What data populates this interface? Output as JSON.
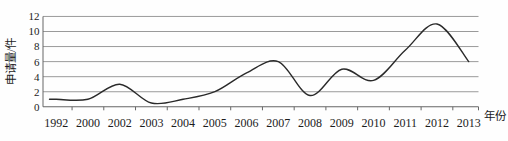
{
  "chart_data": {
    "type": "line",
    "title": "",
    "ylabel": "申请量/件",
    "xlabel": "年份",
    "categories": [
      "1992",
      "2000",
      "2002",
      "2003",
      "2004",
      "2005",
      "2006",
      "2007",
      "2008",
      "2009",
      "2010",
      "2011",
      "2012",
      "2013"
    ],
    "values": [
      1,
      1,
      3,
      0.5,
      1,
      2,
      4.5,
      6,
      1.5,
      5,
      3.5,
      7.5,
      11,
      6
    ],
    "yticks": [
      0,
      2,
      4,
      6,
      8,
      10,
      12
    ],
    "ylim": [
      0,
      12
    ],
    "xlim_note": "categorical axis, equal spacing",
    "grid": "horizontal",
    "legend": "none",
    "smooth": true,
    "line_color": "#2a2a2a",
    "grid_color": "#8f8f8f",
    "axis_color": "#666666",
    "text_color": "#1c1c1c"
  }
}
